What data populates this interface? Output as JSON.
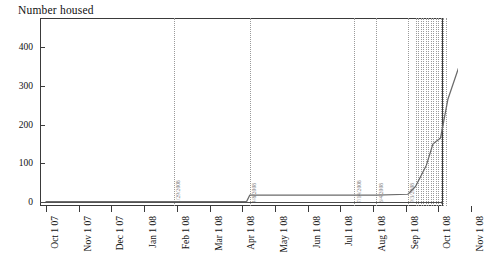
{
  "chart_data": {
    "type": "line",
    "title": "Number housed",
    "xlabel": "",
    "ylabel": "",
    "ylim": [
      -60,
      485
    ],
    "xlim": [
      "Sep 15 2007",
      "Nov 8 2008"
    ],
    "grid": false,
    "legend": "none",
    "y_ticks": [
      0,
      100,
      200,
      300,
      400
    ],
    "y_tick_labels": [
      "0",
      "100",
      "200",
      "300",
      "400"
    ],
    "x_tick_labels": [
      "Oct 1 07",
      "Nov 1 07",
      "Dec 1 07",
      "Jan 1 08",
      "Feb 1 08",
      "Mar 1 08",
      "Apr 1 08",
      "May 1 08",
      "Jun 1 08",
      "Jul 1 08",
      "Aug 1 08",
      "Sep 1 08",
      "Oct 1 08",
      "Nov 1 08"
    ],
    "series": [
      {
        "name": "Number housed",
        "x": [
          "Oct 1 07",
          "Jan 29 08",
          "Apr 5 08",
          "Apr 8 08",
          "Jul 14 08",
          "Aug 4 08",
          "Sep 3 08",
          "Sep 10 08",
          "Sep 20 08",
          "Sep 26 08",
          "Oct 3 08",
          "Oct 10 08",
          "Oct 20 08",
          "Nov 1 08"
        ],
        "values": [
          1,
          1,
          1,
          18,
          18,
          18,
          20,
          40,
          95,
          150,
          165,
          265,
          345,
          435
        ]
      }
    ],
    "annotations": [
      {
        "label": "1/29/2008",
        "x": "Jan 29 08"
      },
      {
        "label": "4/8/2008",
        "x": "Apr 8 08"
      },
      {
        "label": "7/14/2008",
        "x": "Jul 14 08"
      },
      {
        "label": "8/4/2008",
        "x": "Aug 4 08"
      },
      {
        "label": "9/3/2008",
        "x": "Sep 3 08"
      }
    ],
    "annotation_cluster": {
      "label": "",
      "count": 13,
      "x_start": "Sep 10 08",
      "x_end": "Oct 8 08"
    },
    "colors": {
      "series_line": "#6b6b6b",
      "axis": "#3a3a3a",
      "annotation_line": "#9a9a9a",
      "annotation_text": "#777777",
      "background": "#ffffff",
      "text": "#111111"
    }
  }
}
